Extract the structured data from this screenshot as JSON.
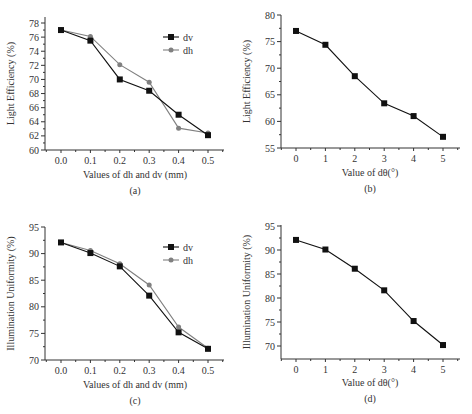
{
  "chart_data": [
    {
      "id": "a",
      "type": "line",
      "subtitle": "(a)",
      "xlabel": "Values of dh and dv (mm)",
      "ylabel": "Light Efficiency (%)",
      "categories": [
        "0.0",
        "0.1",
        "0.2",
        "0.3",
        "0.4",
        "0.5"
      ],
      "x": [
        0.0,
        0.1,
        0.2,
        0.3,
        0.4,
        0.5
      ],
      "series": [
        {
          "name": "dv",
          "marker": "square",
          "color": "#111111",
          "values": [
            77.0,
            75.5,
            70.0,
            68.4,
            65.0,
            62.1
          ]
        },
        {
          "name": "dh",
          "marker": "circle",
          "color": "#808080",
          "values": [
            77.0,
            76.1,
            72.1,
            69.6,
            63.1,
            62.4
          ]
        }
      ],
      "ylim": [
        60,
        78
      ],
      "yticks": [
        60,
        62,
        64,
        66,
        68,
        70,
        72,
        74,
        76,
        78
      ],
      "grid": false,
      "legend_position": "upper right"
    },
    {
      "id": "b",
      "type": "line",
      "subtitle": "(b)",
      "xlabel": "Value of dθ(°)",
      "ylabel": "Light Efficiency (%)",
      "categories": [
        "0",
        "1",
        "2",
        "3",
        "4",
        "5"
      ],
      "x": [
        0,
        1,
        2,
        3,
        4,
        5
      ],
      "series": [
        {
          "name": "dθ",
          "marker": "square",
          "color": "#111111",
          "values": [
            77.0,
            74.4,
            68.5,
            63.4,
            61.0,
            57.1
          ]
        }
      ],
      "ylim": [
        55,
        80
      ],
      "yticks": [
        55,
        60,
        65,
        70,
        75,
        80
      ],
      "grid": false,
      "legend_position": "none"
    },
    {
      "id": "c",
      "type": "line",
      "subtitle": "(c)",
      "xlabel": "Values of dh and dv (mm)",
      "ylabel": "Illumination Uniformity (%)",
      "categories": [
        "0.0",
        "0.1",
        "0.2",
        "0.3",
        "0.4",
        "0.5"
      ],
      "x": [
        0.0,
        0.1,
        0.2,
        0.3,
        0.4,
        0.5
      ],
      "series": [
        {
          "name": "dv",
          "marker": "square",
          "color": "#111111",
          "values": [
            92.1,
            90.1,
            87.6,
            82.1,
            75.2,
            72.1
          ]
        },
        {
          "name": "dh",
          "marker": "circle",
          "color": "#808080",
          "values": [
            92.1,
            90.6,
            88.1,
            84.1,
            76.2,
            72.2
          ]
        }
      ],
      "ylim": [
        70,
        95
      ],
      "yticks": [
        70,
        75,
        80,
        85,
        90,
        95
      ],
      "grid": false,
      "legend_position": "upper right"
    },
    {
      "id": "d",
      "type": "line",
      "subtitle": "(d)",
      "xlabel": "Value of dθ(°)",
      "ylabel": "Illumination Uniformity (%)",
      "categories": [
        "0",
        "1",
        "2",
        "3",
        "4",
        "5"
      ],
      "x": [
        0,
        1,
        2,
        3,
        4,
        5
      ],
      "series": [
        {
          "name": "dθ",
          "marker": "square",
          "color": "#111111",
          "values": [
            92.1,
            90.1,
            86.1,
            81.6,
            75.2,
            70.2
          ]
        }
      ],
      "ylim": [
        67.5,
        95
      ],
      "yticks": [
        70,
        75,
        80,
        85,
        90,
        95
      ],
      "grid": false,
      "legend_position": "none"
    }
  ]
}
